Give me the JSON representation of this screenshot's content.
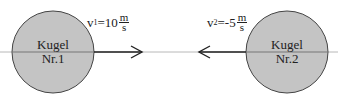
{
  "diagram": {
    "balls": [
      {
        "label_line1": "Kugel",
        "label_line2": "Nr.1",
        "fill": "#c4c4c4"
      },
      {
        "label_line1": "Kugel",
        "label_line2": "Nr.2",
        "fill": "#c4c4c4"
      }
    ],
    "velocities": [
      {
        "symbol": "v",
        "index": "1",
        "equals": "=",
        "value": "10",
        "unit_num": "m",
        "unit_den": "s",
        "direction": "right"
      },
      {
        "symbol": "v",
        "index": "2",
        "equals": "=",
        "value": "-5",
        "unit_num": "m",
        "unit_den": "s",
        "direction": "left"
      }
    ]
  }
}
